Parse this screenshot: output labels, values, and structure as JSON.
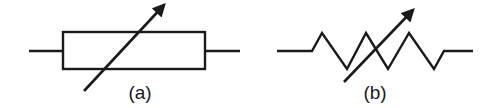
{
  "diagram": {
    "colors": {
      "stroke": "#1a1a1a",
      "background": "#ffffff"
    },
    "symbols": [
      {
        "id": "a",
        "label": "(a)",
        "type": "variable-resistor-rectangular",
        "description": "Variable resistor, rectangle body with diagonal arrow"
      },
      {
        "id": "b",
        "label": "(b)",
        "type": "variable-resistor-zigzag",
        "description": "Variable resistor, zigzag body with diagonal arrow"
      }
    ]
  }
}
